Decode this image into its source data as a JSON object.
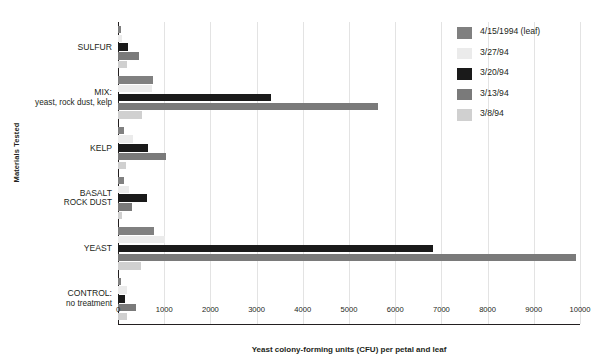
{
  "chart_data": {
    "type": "bar",
    "orientation": "horizontal",
    "title": "",
    "xlabel": "Yeast colony-forming units (CFU) per petal and leaf",
    "ylabel": "Materials Tested",
    "xlim": [
      0,
      10000
    ],
    "xticks": [
      0,
      1000,
      2000,
      3000,
      4000,
      5000,
      6000,
      7000,
      8000,
      9000,
      10000
    ],
    "xtick_labels": [
      "0",
      "1000",
      "2000",
      "3000",
      "4000",
      "5000",
      "6000",
      "7000",
      "8000",
      "9000",
      "10000"
    ],
    "grid": true,
    "legend_position": "top-right",
    "categories": [
      {
        "label": "SULFUR",
        "sub": ""
      },
      {
        "label": "MIX:",
        "sub": "yeast, rock dust, kelp"
      },
      {
        "label": "KELP",
        "sub": ""
      },
      {
        "label": "BASALT",
        "sub": "ROCK DUST"
      },
      {
        "label": "YEAST",
        "sub": ""
      },
      {
        "label": "CONTROL:",
        "sub": "no treatment"
      }
    ],
    "category_labels": [
      "SULFUR",
      "MIX: yeast, rock dust, kelp",
      "KELP",
      "BASALT ROCK DUST",
      "YEAST",
      "CONTROL: no treatment"
    ],
    "series": [
      {
        "name": "4/15/1994 (leaf)",
        "color": "#808080",
        "values": [
          60,
          760,
          140,
          120,
          790,
          70
        ]
      },
      {
        "name": "3/27/94",
        "color": "#ebebeb",
        "values": [
          90,
          730,
          320,
          230,
          1010,
          200
        ]
      },
      {
        "name": "3/20/94",
        "color": "#1a1a1a",
        "values": [
          215,
          3310,
          645,
          620,
          6817,
          150
        ]
      },
      {
        "name": "3/13/94",
        "color": "#7a7a7a",
        "values": [
          450,
          5634,
          1030,
          300,
          9913,
          380
        ]
      },
      {
        "name": "3/8/94",
        "color": "#d0d0d0",
        "values": [
          190,
          520,
          175,
          90,
          500,
          190
        ]
      }
    ]
  },
  "legend": {
    "items": [
      {
        "label": "4/15/1994 (leaf)",
        "color": "#808080"
      },
      {
        "label": "3/27/94",
        "color": "#ebebeb"
      },
      {
        "label": "3/20/94",
        "color": "#1a1a1a"
      },
      {
        "label": "3/13/94",
        "color": "#7a7a7a"
      },
      {
        "label": "3/8/94",
        "color": "#d0d0d0"
      }
    ]
  },
  "axes": {
    "x_title": "Yeast colony-forming units (CFU) per petal and leaf",
    "y_title": "Materials Tested"
  }
}
